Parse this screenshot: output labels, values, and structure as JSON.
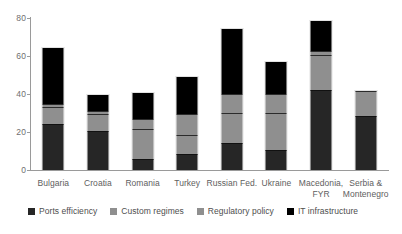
{
  "chart_data": {
    "type": "bar",
    "stacked": true,
    "title": "",
    "subtitle": "",
    "xlabel": "",
    "ylabel": "",
    "ylim": [
      0,
      80
    ],
    "ytick_labels": [
      "0",
      "20",
      "40",
      "60",
      "80"
    ],
    "ytick_values": [
      0,
      20,
      40,
      60,
      80
    ],
    "grid": false,
    "legend_position": "bottom",
    "categories": [
      "Bulgaria",
      "Croatia",
      "Romania",
      "Turkey",
      "Russian Fed.",
      "Ukraine",
      "Macedonia, FYR",
      "Serbia & Montenegro"
    ],
    "category_labels": [
      [
        "Bulgaria"
      ],
      [
        "Croatia"
      ],
      [
        "Romania"
      ],
      [
        "Turkey"
      ],
      [
        "Russian Fed."
      ],
      [
        "Ukraine"
      ],
      [
        "Macedonia,",
        "FYR"
      ],
      [
        "Serbia &",
        "Montenegro"
      ]
    ],
    "series": [
      {
        "name": "Ports efficiency",
        "color": "#262626",
        "values": [
          24.0,
          20.5,
          6.0,
          8.5,
          14.0,
          10.5,
          42.0,
          28.5
        ]
      },
      {
        "name": "Custom regimes",
        "color": "#8f8f8f",
        "values": [
          9.0,
          9.0,
          15.5,
          10.0,
          16.0,
          19.5,
          18.5,
          13.0
        ]
      },
      {
        "name": "Regulatory policy",
        "color": "#8f8f8f",
        "values": [
          1.5,
          1.5,
          5.5,
          11.0,
          10.0,
          10.0,
          2.0,
          0.0
        ]
      },
      {
        "name": "IT infrastructure",
        "color": "#000000",
        "values": [
          29.5,
          8.5,
          13.5,
          19.5,
          34.0,
          17.0,
          16.0,
          0.0
        ]
      }
    ],
    "totals": [
      64.0,
      39.5,
      40.5,
      49.5,
      74.0,
      57.0,
      78.5,
      41.5
    ]
  },
  "legend": {
    "items": [
      {
        "label": "Ports efficiency",
        "color": "#262626"
      },
      {
        "label": "Custom regimes",
        "color": "#8f8f8f"
      },
      {
        "label": "Regulatory policy",
        "color": "#8f8f8f"
      },
      {
        "label": "IT infrastructure",
        "color": "#000000"
      }
    ]
  }
}
